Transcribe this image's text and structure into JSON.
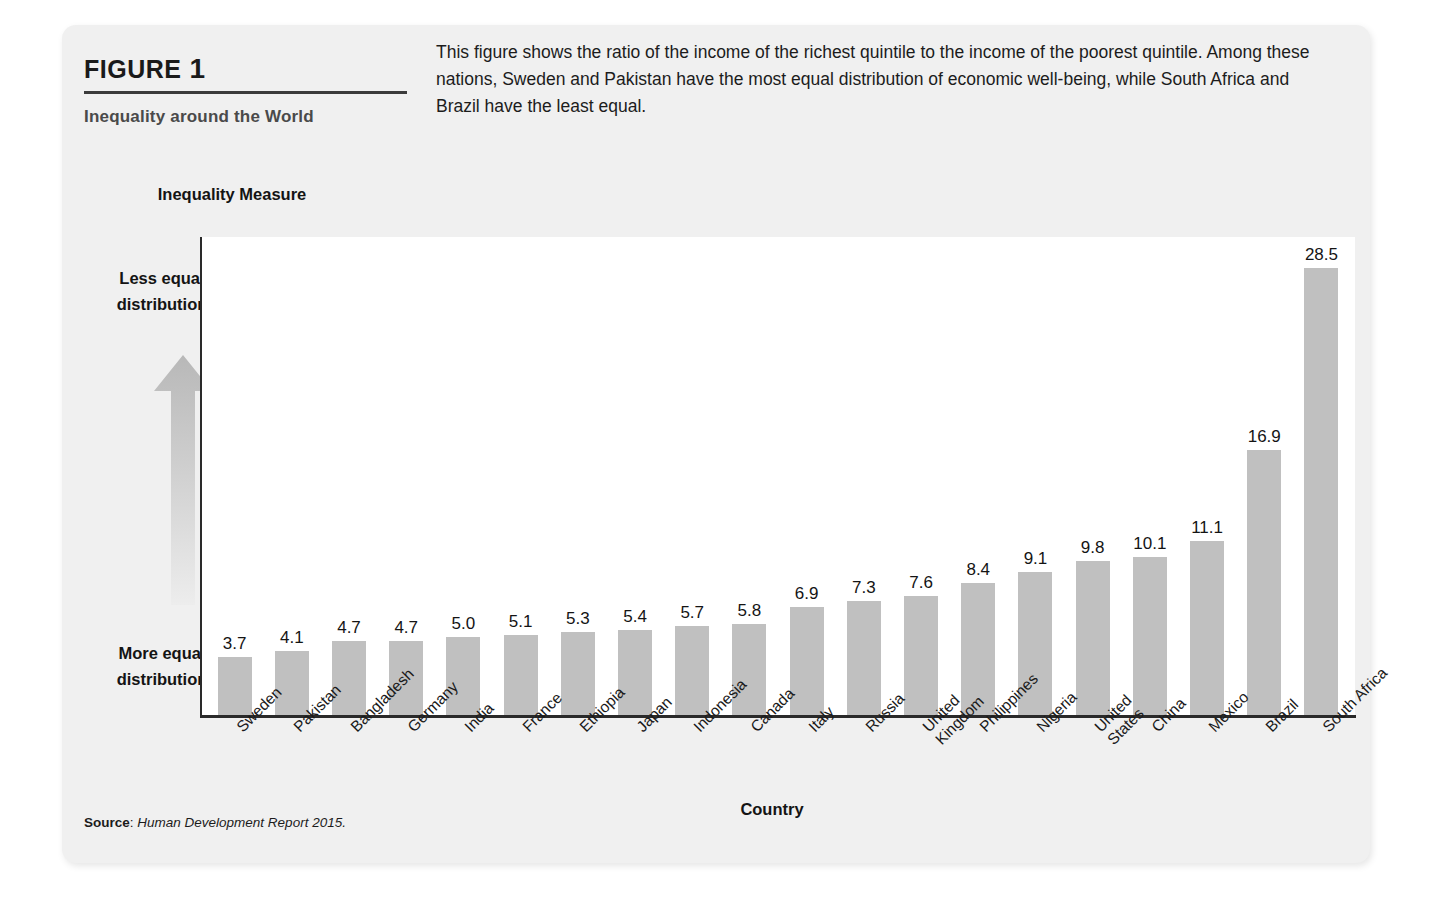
{
  "figure": {
    "label": "FIGURE",
    "number": "1",
    "subtitle": "Inequality around the World",
    "description": "This figure shows the ratio of the income of the richest quintile to the income of the poorest quintile. Among these nations, Sweden and Pakistan have the most equal distribution of economic well-being, while South Africa and Brazil have the least equal.",
    "source_label": "Source",
    "source_text": "Human Development Report 2015."
  },
  "annotations": {
    "y_axis_title": "Inequality Measure",
    "less_equal": "Less equal distribution",
    "more_equal": "More equal distribution",
    "x_axis_title": "Country",
    "arrow_icon": "up-arrow-icon"
  },
  "colors": {
    "bar": "#c0c0c0",
    "card_background": "#f0f0f0",
    "plot_background": "#ffffff",
    "axis": "#2a2a2a",
    "text": "#141414"
  },
  "chart_data": {
    "type": "bar",
    "title": "Inequality around the World",
    "xlabel": "Country",
    "ylabel": "Inequality Measure",
    "ylim": [
      0,
      30.5
    ],
    "grid": false,
    "legend": null,
    "value_labels": true,
    "categories": [
      "Sweden",
      "Pakistan",
      "Bangladesh",
      "Germany",
      "India",
      "France",
      "Ethiopia",
      "Japan",
      "Indonesia",
      "Canada",
      "Italy",
      "Russia",
      "United Kingdom",
      "Philippines",
      "Nigeria",
      "United States",
      "China",
      "Mexico",
      "Brazil",
      "South Africa"
    ],
    "values": [
      3.7,
      4.1,
      4.7,
      4.7,
      5.0,
      5.1,
      5.3,
      5.4,
      5.7,
      5.8,
      6.9,
      7.3,
      7.6,
      8.4,
      9.1,
      9.8,
      10.1,
      11.1,
      16.9,
      28.5
    ],
    "value_label_text": [
      "3.7",
      "4.1",
      "4.7",
      "4.7",
      "5.0",
      "5.1",
      "5.3",
      "5.4",
      "5.7",
      "5.8",
      "6.9",
      "7.3",
      "7.6",
      "8.4",
      "9.1",
      "9.8",
      "10.1",
      "11.1",
      "16.9",
      "28.5"
    ],
    "annotations": [
      "Less equal distribution",
      "More equal distribution"
    ]
  }
}
